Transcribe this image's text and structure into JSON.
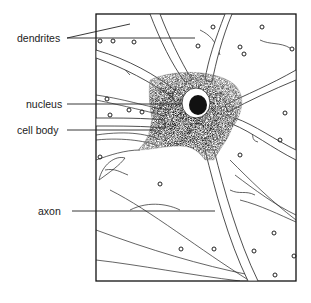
{
  "diagram": {
    "labels": [
      {
        "id": "dendrites",
        "text": "dendrites"
      },
      {
        "id": "nucleus",
        "text": "nucleus"
      },
      {
        "id": "cell_body",
        "text": "cell body"
      },
      {
        "id": "axon",
        "text": "axon"
      }
    ]
  }
}
